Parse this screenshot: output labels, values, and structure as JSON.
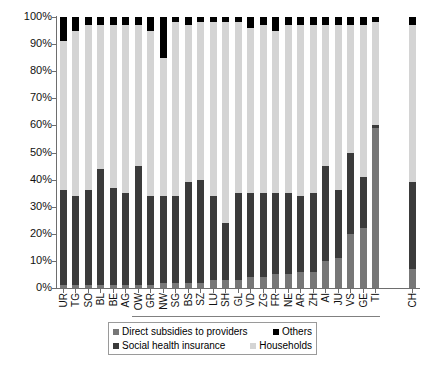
{
  "chart_data": {
    "type": "bar",
    "subtype": "stacked-percentage-column",
    "title": "",
    "xlabel": "",
    "ylabel": "",
    "ylim": [
      0,
      100
    ],
    "ytick_labels": [
      "0%",
      "10%",
      "20%",
      "30%",
      "40%",
      "50%",
      "60%",
      "70%",
      "80%",
      "90%",
      "100%"
    ],
    "ytick_values": [
      0,
      10,
      20,
      30,
      40,
      50,
      60,
      70,
      80,
      90,
      100
    ],
    "grid": false,
    "legend_position": "bottom",
    "stack_order_bottom_to_top": [
      "Direct subsidies to providers",
      "Social health insurance",
      "Households",
      "Others"
    ],
    "categories": [
      "UR",
      "TG",
      "SO",
      "BL",
      "BE",
      "AG",
      "OW",
      "GR",
      "NW",
      "SG",
      "BS",
      "SZ",
      "LU",
      "SH",
      "GL",
      "VD",
      "ZG",
      "FR",
      "NE",
      "AR",
      "ZH",
      "AI",
      "JU",
      "VS",
      "GE",
      "TI",
      "CH"
    ],
    "series": [
      {
        "name": "Direct subsidies to providers",
        "color": "#777777",
        "values": [
          1,
          1,
          1,
          1,
          1,
          1,
          1,
          1,
          2,
          2,
          2,
          2,
          3,
          3,
          3,
          4,
          4,
          5,
          5,
          6,
          6,
          10,
          11,
          20,
          22,
          59,
          7
        ]
      },
      {
        "name": "Social health insurance",
        "color": "#3b3b3b",
        "values": [
          35,
          33,
          35,
          43,
          36,
          34,
          44,
          33,
          32,
          32,
          37,
          38,
          31,
          21,
          32,
          31,
          31,
          30,
          30,
          28,
          29,
          35,
          25,
          30,
          19,
          1,
          32
        ]
      },
      {
        "name": "Households",
        "color": "#d4d4d4",
        "values": [
          55,
          61,
          61,
          53,
          60,
          62,
          52,
          61,
          51,
          64,
          58,
          58,
          64,
          74,
          63,
          61,
          62,
          60,
          62,
          63,
          62,
          52,
          61,
          47,
          56,
          38,
          58
        ]
      },
      {
        "name": "Others",
        "color": "#000000",
        "values": [
          9,
          5,
          3,
          3,
          3,
          3,
          3,
          5,
          15,
          2,
          3,
          2,
          2,
          2,
          2,
          4,
          3,
          5,
          3,
          3,
          3,
          3,
          3,
          3,
          3,
          2,
          3
        ]
      }
    ]
  },
  "legend": {
    "items": [
      {
        "label": "Direct subsidies to providers",
        "key": "direct"
      },
      {
        "label": "Others",
        "key": "others"
      },
      {
        "label": "Social health insurance",
        "key": "social"
      },
      {
        "label": "Households",
        "key": "house"
      }
    ]
  }
}
